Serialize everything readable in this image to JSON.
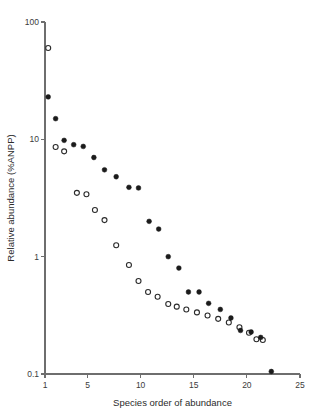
{
  "chart_data": {
    "type": "scatter",
    "title": "",
    "xlabel": "Species order of abundance",
    "ylabel": "Relative abundance (%ANPP)",
    "xlim": [
      1,
      25
    ],
    "ylim": [
      0.1,
      100
    ],
    "yscale": "log",
    "xscale": "linear",
    "grid": false,
    "legend": "none",
    "xticks": [
      1,
      5,
      10,
      15,
      20,
      25
    ],
    "xtick_labels": [
      "1",
      "5",
      "10",
      "15",
      "20",
      "25"
    ],
    "yticks": [
      0.1,
      1,
      10,
      100
    ],
    "ytick_labels": [
      "0.1",
      "1",
      "10",
      "100"
    ],
    "series": [
      {
        "name": "open-circles",
        "marker": "open-circle",
        "color": "#2a2a2a",
        "points": [
          {
            "x": 1.3,
            "y": 60.0
          },
          {
            "x": 2.0,
            "y": 8.6
          },
          {
            "x": 2.8,
            "y": 7.9
          },
          {
            "x": 4.0,
            "y": 3.5
          },
          {
            "x": 4.9,
            "y": 3.4
          },
          {
            "x": 5.7,
            "y": 2.5
          },
          {
            "x": 6.6,
            "y": 2.05
          },
          {
            "x": 7.7,
            "y": 1.25
          },
          {
            "x": 8.9,
            "y": 0.85
          },
          {
            "x": 9.8,
            "y": 0.62
          },
          {
            "x": 10.7,
            "y": 0.5
          },
          {
            "x": 11.6,
            "y": 0.455
          },
          {
            "x": 12.6,
            "y": 0.395
          },
          {
            "x": 13.4,
            "y": 0.375
          },
          {
            "x": 14.3,
            "y": 0.355
          },
          {
            "x": 15.3,
            "y": 0.335
          },
          {
            "x": 16.3,
            "y": 0.315
          },
          {
            "x": 17.3,
            "y": 0.295
          },
          {
            "x": 18.3,
            "y": 0.275
          },
          {
            "x": 19.3,
            "y": 0.25
          },
          {
            "x": 20.2,
            "y": 0.225
          },
          {
            "x": 20.9,
            "y": 0.198
          },
          {
            "x": 21.5,
            "y": 0.195
          }
        ]
      },
      {
        "name": "filled-circles",
        "marker": "filled-circle",
        "color": "#1b1b1b",
        "points": [
          {
            "x": 1.3,
            "y": 23.0
          },
          {
            "x": 2.0,
            "y": 15.0
          },
          {
            "x": 2.8,
            "y": 9.8
          },
          {
            "x": 3.7,
            "y": 9.0
          },
          {
            "x": 4.6,
            "y": 8.7
          },
          {
            "x": 5.6,
            "y": 7.0
          },
          {
            "x": 6.6,
            "y": 5.5
          },
          {
            "x": 7.7,
            "y": 4.8
          },
          {
            "x": 8.9,
            "y": 3.9
          },
          {
            "x": 9.8,
            "y": 3.85
          },
          {
            "x": 10.8,
            "y": 2.0
          },
          {
            "x": 11.7,
            "y": 1.72
          },
          {
            "x": 12.6,
            "y": 1.0
          },
          {
            "x": 13.6,
            "y": 0.8
          },
          {
            "x": 14.5,
            "y": 0.5
          },
          {
            "x": 15.5,
            "y": 0.5
          },
          {
            "x": 16.4,
            "y": 0.4
          },
          {
            "x": 17.5,
            "y": 0.355
          },
          {
            "x": 18.5,
            "y": 0.3
          },
          {
            "x": 19.4,
            "y": 0.235
          },
          {
            "x": 20.4,
            "y": 0.228
          },
          {
            "x": 21.3,
            "y": 0.205
          },
          {
            "x": 22.3,
            "y": 0.105
          }
        ]
      }
    ]
  }
}
